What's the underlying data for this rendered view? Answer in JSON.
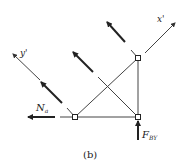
{
  "figure": {
    "caption": "(b)",
    "labels": {
      "x_axis": "x'",
      "y_axis": "y'",
      "force_left": "N",
      "force_left_sub": "a",
      "force_bottom": "F",
      "force_bottom_sub": "BY"
    },
    "colors": {
      "line": "#333333",
      "background": "#ffffff"
    }
  }
}
